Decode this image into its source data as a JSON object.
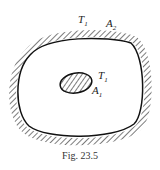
{
  "figure": {
    "caption": "Fig. 23.5",
    "outer_surface": {
      "temperature_label": "T",
      "temperature_sub": "1",
      "area_label": "A",
      "area_sub": "2"
    },
    "inner_body": {
      "temperature_label": "T",
      "temperature_sub": "1",
      "area_label": "A",
      "area_sub": "1"
    }
  }
}
